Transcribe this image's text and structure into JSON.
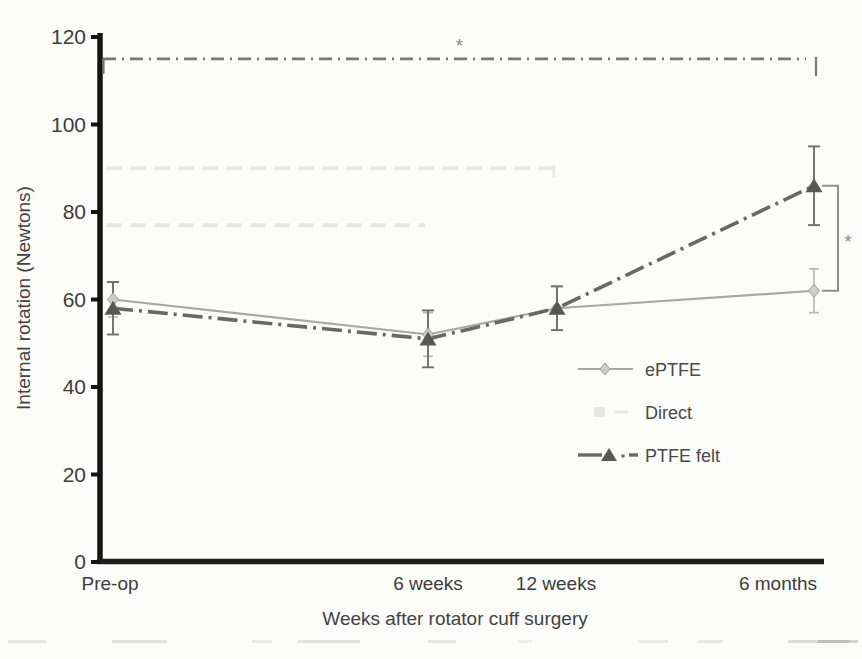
{
  "figure": {
    "type_label": "line chart (scanned journal figure)",
    "y_axis": {
      "title": "Internal rotation (Newtons)",
      "min": 0,
      "max": 120,
      "tick_step": 20,
      "ticks": [
        0,
        20,
        40,
        60,
        80,
        100,
        120
      ]
    },
    "x_axis": {
      "title": "Weeks after rotator cuff surgery",
      "categories": [
        "Pre-op",
        "6 weeks",
        "12 weeks",
        "6 months"
      ]
    },
    "legend": {
      "position": "center-right",
      "items": [
        {
          "label": "ePTFE",
          "marker": "diamond",
          "line": "solid",
          "color": "#a8a8a8"
        },
        {
          "label": "Direct",
          "marker": "square-faded",
          "line": "faded",
          "color": "#d6d6d0"
        },
        {
          "label": "PTFE felt",
          "marker": "triangle",
          "line": "dash-dot",
          "color": "#686868"
        }
      ]
    }
  },
  "chart_data": {
    "type": "line",
    "title": "",
    "xlabel": "Weeks after rotator cuff surgery",
    "ylabel": "Internal rotation (Newtons)",
    "ylim": [
      0,
      120
    ],
    "grid": false,
    "categories": [
      "Pre-op",
      "6 weeks",
      "12 weeks",
      "6 months"
    ],
    "series": [
      {
        "name": "ePTFE",
        "values": [
          60,
          52,
          58,
          62
        ],
        "error_plus": [
          4,
          5,
          5,
          5
        ],
        "error_minus": [
          4,
          5,
          5,
          5
        ],
        "marker": "diamond",
        "line_style": "solid",
        "color": "#a8a8a8",
        "marker_fill": "#cdcdca",
        "marker_stroke": "#9a9a9a"
      },
      {
        "name": "Direct",
        "values": [
          null,
          null,
          null,
          null
        ],
        "note": "printed too faint to read in scan",
        "marker": "square",
        "line_style": "faded",
        "color": "#d6d6d0"
      },
      {
        "name": "PTFE felt",
        "values": [
          58,
          51,
          58,
          86
        ],
        "error_plus": [
          6,
          6.5,
          5,
          9
        ],
        "error_minus": [
          6,
          6.5,
          5,
          9
        ],
        "marker": "triangle",
        "line_style": "dash-dot",
        "color": "#686868",
        "marker_fill": "#575757"
      }
    ],
    "annotations": [
      {
        "id": "overall-significance",
        "symbol": "*",
        "type": "bracket-horizontal",
        "y_value": 115,
        "from_category": "Pre-op",
        "to_category": "6 months",
        "line_style": "dash-dot",
        "color": "#787878"
      },
      {
        "id": "six-month-significance",
        "symbol": "*",
        "type": "bracket-vertical",
        "at_category": "6 months",
        "from_series": "PTFE felt",
        "to_series": "ePTFE",
        "color": "#8f8f8f"
      }
    ],
    "faint_traces": [
      {
        "y_value": 90,
        "from_category": "Pre-op",
        "to_category": "12 weeks"
      },
      {
        "y_value": 77,
        "from_category": "Pre-op",
        "to_category": "6 weeks"
      }
    ],
    "layout_hints": {
      "category_x_px": [
        113,
        428,
        557,
        814
      ],
      "plot_top_px": 37,
      "plot_bottom_px": 562,
      "axis_x_px": 100,
      "axis_right_px": 824,
      "legend_x_px": 578,
      "legend_rows_y_px": [
        369,
        412,
        455
      ]
    }
  }
}
